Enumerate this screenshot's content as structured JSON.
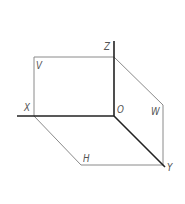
{
  "diagram": {
    "colors": {
      "axis": "#222222",
      "plane_edge": "#8a8a8a",
      "label": "#555555"
    },
    "labels": {
      "x_axis": "X",
      "y_axis": "Y",
      "z_axis": "Z",
      "origin": "O",
      "v_plane": "V",
      "h_plane": "H",
      "w_plane": "W"
    }
  }
}
